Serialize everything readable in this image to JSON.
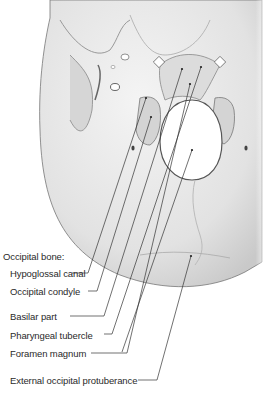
{
  "figure": {
    "group_label": "Occipital bone:",
    "labels": [
      {
        "id": "hypoglossal-canal",
        "text": "Hypoglossal canal"
      },
      {
        "id": "occipital-condyle",
        "text": "Occipital condyle"
      },
      {
        "id": "basilar-part",
        "text": "Basilar part"
      },
      {
        "id": "pharyngeal-tubercle",
        "text": "Pharyngeal tubercle"
      },
      {
        "id": "foramen-magnum",
        "text": "Foramen magnum"
      },
      {
        "id": "external-occipital-protuberance",
        "text": "External occipital protuberance"
      }
    ],
    "colors": {
      "background": "#ffffff",
      "bone": "#e6e6e6",
      "shade": "#bdbdbd",
      "outline": "#6e6e6e",
      "leader": "#333333",
      "text": "#2a2a2a"
    }
  }
}
